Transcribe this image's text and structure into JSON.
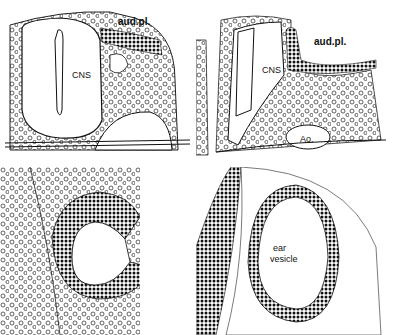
{
  "figure": {
    "panels": [
      {
        "id": "top-left",
        "labels": {
          "cns": "CNS",
          "aud": "aud.pl."
        }
      },
      {
        "id": "top-right",
        "labels": {
          "cns": "CNS",
          "aud": "aud.pl.",
          "ao": "Ao."
        }
      },
      {
        "id": "bottom-left",
        "labels": {}
      },
      {
        "id": "bottom-right",
        "labels": {
          "ear1": "ear",
          "ear2": "vesicle"
        }
      }
    ],
    "colors": {
      "ink": "#111111",
      "paper": "#ffffff"
    }
  }
}
